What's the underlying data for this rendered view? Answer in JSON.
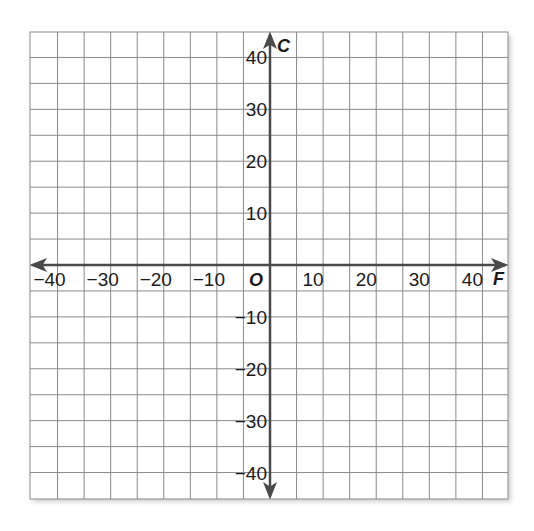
{
  "chart_data": {
    "type": "scatter",
    "title": "",
    "xlabel": "F",
    "ylabel": "C",
    "origin_label": "O",
    "xlim": [
      -45,
      45
    ],
    "ylim": [
      -45,
      45
    ],
    "grid": true,
    "grid_step": 5,
    "x_ticks": [
      -40,
      -30,
      -20,
      -10,
      10,
      20,
      30,
      40
    ],
    "y_ticks": [
      40,
      30,
      20,
      10,
      -10,
      -20,
      -30,
      -40
    ],
    "x_tick_labels": [
      "−40",
      "−30",
      "−20",
      "−10",
      "10",
      "20",
      "30",
      "40"
    ],
    "y_tick_labels": [
      "40",
      "30",
      "20",
      "10",
      "−10",
      "−20",
      "−30",
      "−40"
    ],
    "series": [],
    "legend": null
  },
  "colors": {
    "grid": "#8a8a8a",
    "axis": "#4a4a4a",
    "text": "#1a1a1a",
    "background": "#ffffff"
  }
}
